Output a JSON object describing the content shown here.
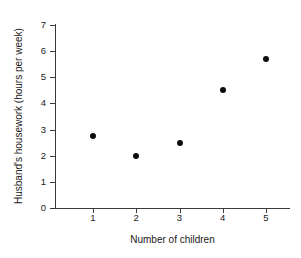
{
  "chart_data": {
    "type": "scatter",
    "title": "",
    "xlabel": "Number of children",
    "ylabel": "Husband's housework (hours per week)",
    "x": [
      1,
      2,
      3,
      4,
      5
    ],
    "values": [
      2.75,
      2.0,
      2.5,
      4.5,
      5.7
    ],
    "xtick_labels": [
      "1",
      "2",
      "3",
      "4",
      "5"
    ],
    "ytick_labels": [
      "0",
      "1",
      "2",
      "3",
      "4",
      "5",
      "6",
      "7"
    ],
    "xlim": [
      0.3,
      5.7
    ],
    "ylim": [
      0,
      7
    ],
    "grid": false,
    "legend": false,
    "marker_color": "#0d0d0d",
    "axis_color": "#3a3a3a",
    "background_color": "#ffffff"
  }
}
